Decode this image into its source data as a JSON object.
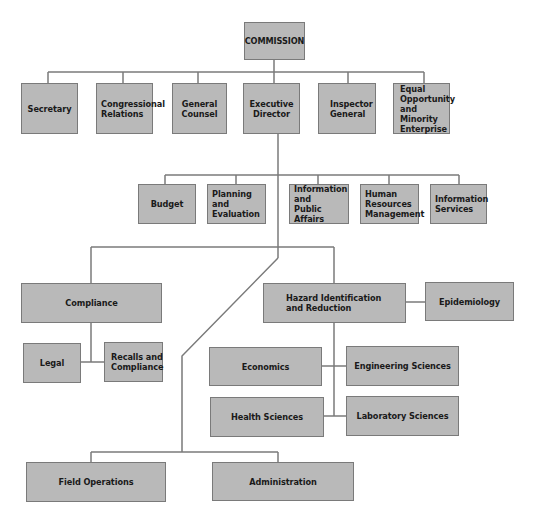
{
  "chart": {
    "root": {
      "id": "commission",
      "label": "COMMISSION"
    },
    "level1": [
      {
        "id": "secretary",
        "label": "Secretary"
      },
      {
        "id": "congressional-relations",
        "label": "Congressional\nRelations"
      },
      {
        "id": "general-counsel",
        "label": "General\nCounsel"
      },
      {
        "id": "executive-director",
        "label": "Executive\nDirector"
      },
      {
        "id": "inspector-general",
        "label": "Inspector\nGeneral"
      },
      {
        "id": "equal-opportunity",
        "label": "Equal\nOpportunity\nand Minority\nEnterprise"
      }
    ],
    "level2_staff": [
      {
        "id": "budget",
        "label": "Budget"
      },
      {
        "id": "planning-evaluation",
        "label": "Planning\nand\nEvaluation"
      },
      {
        "id": "info-public-affairs",
        "label": "Information\nand\nPublic Affairs"
      },
      {
        "id": "human-resources",
        "label": "Human\nResources\nManagement"
      },
      {
        "id": "information-services",
        "label": "Information\nServices"
      }
    ],
    "compliance": {
      "label": "Compliance",
      "children": [
        {
          "id": "legal",
          "label": "Legal"
        },
        {
          "id": "recalls-compliance",
          "label": "Recalls and\nCompliance"
        }
      ]
    },
    "hazard": {
      "label": "Hazard Identification\nand Reduction",
      "side": {
        "id": "epidemiology",
        "label": "Epidemiology"
      },
      "children": [
        {
          "id": "economics",
          "label": "Economics"
        },
        {
          "id": "engineering-sciences",
          "label": "Engineering Sciences"
        },
        {
          "id": "health-sciences",
          "label": "Health Sciences"
        },
        {
          "id": "laboratory-sciences",
          "label": "Laboratory Sciences"
        }
      ]
    },
    "bottom": [
      {
        "id": "field-operations",
        "label": "Field Operations"
      },
      {
        "id": "administration",
        "label": "Administration"
      }
    ],
    "colors": {
      "box_fill": "#b9b9b9",
      "box_border": "#7a7a7a",
      "line": "#7a7a7a",
      "text": "#1a1a1a"
    }
  }
}
